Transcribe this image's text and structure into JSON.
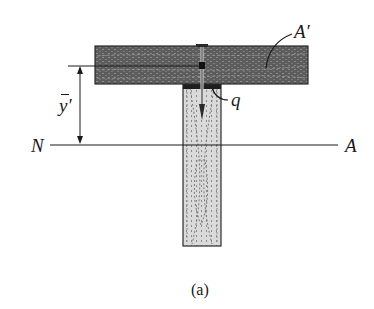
{
  "figure": {
    "caption": "(a)",
    "labels": {
      "area": "A′",
      "shear_flow": "q",
      "centroid_distance_base": "y",
      "centroid_distance_prime": "′",
      "neutral_axis_left": "N",
      "neutral_axis_right": "A"
    },
    "colors": {
      "flange_wood": "#5a5a5a",
      "flange_grain": "#8a8a8a",
      "web_wood": "#d8d8d8",
      "web_grain": "#7a7a7a",
      "line": "#1a1a1a",
      "nail": "#2a2a2a"
    }
  }
}
